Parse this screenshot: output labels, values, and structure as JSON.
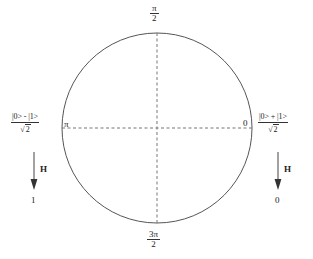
{
  "figure": {
    "type": "bloch-circle-hadamard-diagram",
    "background_color": "#ffffff",
    "stroke_color": "#555555",
    "text_color": "#222222"
  },
  "circle": {
    "center_x": 157,
    "center_y": 128,
    "radius": 95,
    "name": "phase-circle"
  },
  "axes": {
    "horizontal_dashed": true,
    "vertical_dashed": true
  },
  "angle_labels": {
    "top": {
      "numerator": "π",
      "denominator": "2"
    },
    "bottom": {
      "numerator": "3π",
      "denominator": "2"
    },
    "left": "π",
    "right": "0"
  },
  "left_branch": {
    "state_numerator": "|0> - |1>",
    "state_denominator_radicand": "2",
    "state_denominator_symbol": "√",
    "gate_label": "H",
    "output_label": "1",
    "arrow_direction": "down"
  },
  "right_branch": {
    "state_numerator": "|0> + |1>",
    "state_denominator_radicand": "2",
    "state_denominator_symbol": "√",
    "gate_label": "H",
    "output_label": "0",
    "arrow_direction": "down"
  }
}
